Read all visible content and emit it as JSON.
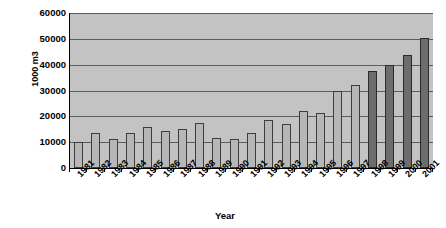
{
  "chart_data": {
    "type": "bar",
    "title": "",
    "xlabel": "Year",
    "ylabel": "1000 m3",
    "ylim": [
      0,
      60000
    ],
    "ytick_values": [
      60000,
      50000,
      40000,
      30000,
      20000,
      10000,
      0
    ],
    "ytick_labels": [
      "60000",
      "50000",
      "40000",
      "30000",
      "20000",
      "10000",
      "0"
    ],
    "grid": true,
    "legend": "none",
    "categories": [
      "1981",
      "1982",
      "1983",
      "1984",
      "1985",
      "1986",
      "1987",
      "1988",
      "1989",
      "1990",
      "1991",
      "1992",
      "1993",
      "1994",
      "1995",
      "1996",
      "1997",
      "1998",
      "1999",
      "2000",
      "2001"
    ],
    "values": [
      10200,
      13600,
      11400,
      13500,
      15800,
      14300,
      15000,
      17600,
      11700,
      11300,
      13700,
      18500,
      17000,
      22000,
      21200,
      29800,
      32200,
      37600,
      39800,
      43800,
      50500
    ],
    "bar_styles": [
      "light",
      "light",
      "light",
      "light",
      "light",
      "light",
      "light",
      "light",
      "light",
      "light",
      "light",
      "light",
      "light",
      "light",
      "light",
      "light",
      "light",
      "dark",
      "dark",
      "dark",
      "dark"
    ]
  },
  "colors": {
    "plot_background": "#c3c3c3",
    "bar_light": "#b7b7b7",
    "bar_dark": "#6d6d6d",
    "gridline": "#5d5d5d",
    "axis": "#000000",
    "page_background": "#ffffff"
  }
}
